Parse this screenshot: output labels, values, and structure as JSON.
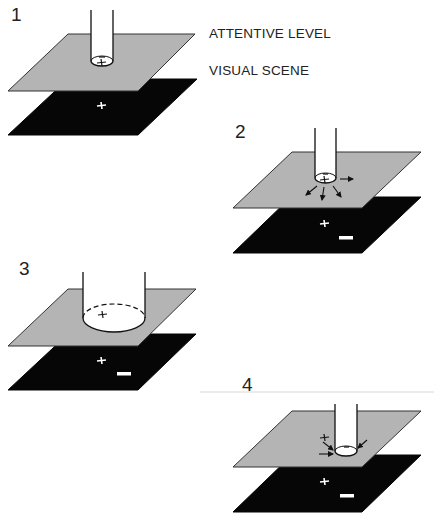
{
  "legend": {
    "attentive_level": "ATTENTIVE LEVEL",
    "visual_scene": "VISUAL SCENE"
  },
  "colors": {
    "attentive_plane": "#b4b4b4",
    "scene_plane": "#060606",
    "tube": "#ffffff",
    "outline": "#111111"
  },
  "steps": [
    {
      "number": "1",
      "description": "Narrow attentional tube focused on '+' item",
      "marks_attentive": [
        "−",
        "+"
      ],
      "marks_scene": [
        "+"
      ]
    },
    {
      "number": "2",
      "description": "Activity spreads outward from attentional focus (arrows)",
      "marks_attentive": [
        "−",
        "+"
      ],
      "marks_scene": [
        "+",
        "−"
      ]
    },
    {
      "number": "3",
      "description": "Attentional tube widens (dashed top rim)",
      "marks_attentive": [
        "+"
      ],
      "marks_scene": [
        "+",
        "−"
      ]
    },
    {
      "number": "4",
      "description": "Attention shifts to '−' item; inward arrows",
      "marks_attentive": [
        "+",
        "−"
      ],
      "marks_scene": [
        "+",
        "−"
      ]
    }
  ]
}
